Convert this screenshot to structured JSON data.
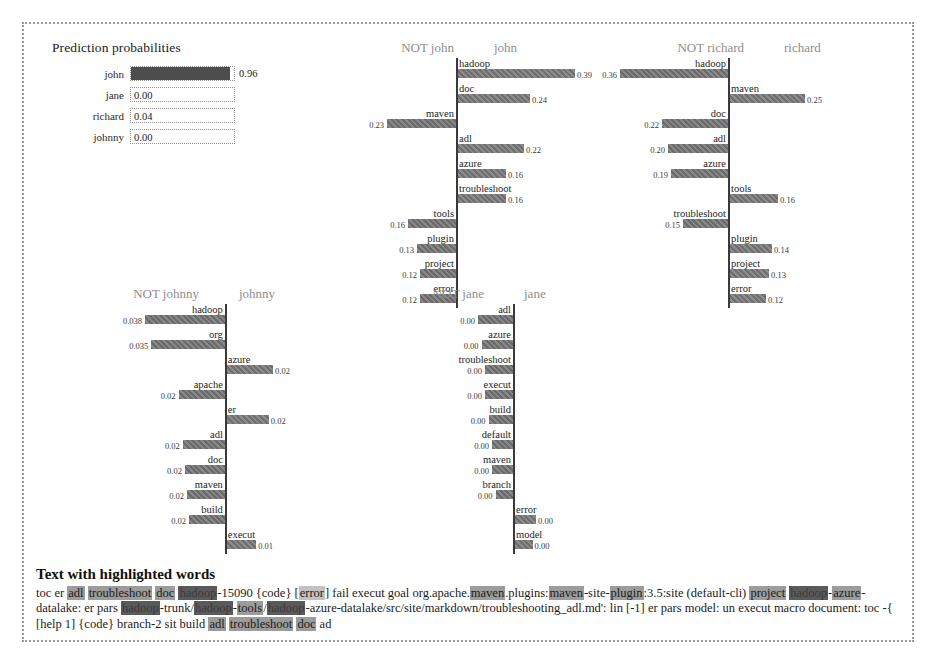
{
  "prediction": {
    "title": "Prediction probabilities",
    "rows": [
      {
        "label": "john",
        "value": "0.96",
        "p": 0.96,
        "filled": true
      },
      {
        "label": "jane",
        "value": "0.00",
        "p": 0.0,
        "filled": false
      },
      {
        "label": "richard",
        "value": "0.04",
        "p": 0.04,
        "filled": false
      },
      {
        "label": "johnny",
        "value": "0.00",
        "p": 0.0,
        "filled": false
      }
    ]
  },
  "panels": [
    {
      "id": "john",
      "neg_label": "NOT john",
      "pos_label": "john",
      "features": [
        {
          "word": "hadoop",
          "value": "0.39",
          "w": 0.39,
          "side": "pos"
        },
        {
          "word": "doc",
          "value": "0.24",
          "w": 0.24,
          "side": "pos"
        },
        {
          "word": "maven",
          "value": "0.23",
          "w": 0.23,
          "side": "neg"
        },
        {
          "word": "adl",
          "value": "0.22",
          "w": 0.22,
          "side": "pos"
        },
        {
          "word": "azure",
          "value": "0.16",
          "w": 0.16,
          "side": "pos"
        },
        {
          "word": "troubleshoot",
          "value": "0.16",
          "w": 0.16,
          "side": "pos"
        },
        {
          "word": "tools",
          "value": "0.16",
          "w": 0.16,
          "side": "neg"
        },
        {
          "word": "plugin",
          "value": "0.13",
          "w": 0.13,
          "side": "neg"
        },
        {
          "word": "project",
          "value": "0.12",
          "w": 0.12,
          "side": "neg"
        },
        {
          "word": "error",
          "value": "0.12",
          "w": 0.12,
          "side": "neg"
        }
      ]
    },
    {
      "id": "richard",
      "neg_label": "NOT richard",
      "pos_label": "richard",
      "features": [
        {
          "word": "hadoop",
          "value": "0.36",
          "w": 0.36,
          "side": "neg"
        },
        {
          "word": "maven",
          "value": "0.25",
          "w": 0.25,
          "side": "pos"
        },
        {
          "word": "doc",
          "value": "0.22",
          "w": 0.22,
          "side": "neg"
        },
        {
          "word": "adl",
          "value": "0.20",
          "w": 0.2,
          "side": "neg"
        },
        {
          "word": "azure",
          "value": "0.19",
          "w": 0.19,
          "side": "neg"
        },
        {
          "word": "tools",
          "value": "0.16",
          "w": 0.16,
          "side": "pos"
        },
        {
          "word": "troubleshoot",
          "value": "0.15",
          "w": 0.15,
          "side": "neg"
        },
        {
          "word": "plugin",
          "value": "0.14",
          "w": 0.14,
          "side": "pos"
        },
        {
          "word": "project",
          "value": "0.13",
          "w": 0.13,
          "side": "pos"
        },
        {
          "word": "error",
          "value": "0.12",
          "w": 0.12,
          "side": "pos"
        }
      ]
    },
    {
      "id": "johnny",
      "neg_label": "NOT johnny",
      "pos_label": "johnny",
      "features": [
        {
          "word": "hadoop",
          "value": "0.038",
          "w": 0.038,
          "side": "neg"
        },
        {
          "word": "org",
          "value": "0.035",
          "w": 0.035,
          "side": "neg"
        },
        {
          "word": "azure",
          "value": "0.02",
          "w": 0.022,
          "side": "pos"
        },
        {
          "word": "apache",
          "value": "0.02",
          "w": 0.022,
          "side": "neg"
        },
        {
          "word": "er",
          "value": "0.02",
          "w": 0.02,
          "side": "pos"
        },
        {
          "word": "adl",
          "value": "0.02",
          "w": 0.02,
          "side": "neg"
        },
        {
          "word": "doc",
          "value": "0.02",
          "w": 0.019,
          "side": "neg"
        },
        {
          "word": "maven",
          "value": "0.02",
          "w": 0.018,
          "side": "neg"
        },
        {
          "word": "build",
          "value": "0.02",
          "w": 0.017,
          "side": "neg"
        },
        {
          "word": "execut",
          "value": "0.01",
          "w": 0.014,
          "side": "pos"
        }
      ]
    },
    {
      "id": "jane",
      "neg_label": "NOT jane",
      "pos_label": "jane",
      "features": [
        {
          "word": "adl",
          "value": "0.00",
          "w": 0.01,
          "side": "neg"
        },
        {
          "word": "azure",
          "value": "0.00",
          "w": 0.009,
          "side": "neg"
        },
        {
          "word": "troubleshoot",
          "value": "0.00",
          "w": 0.008,
          "side": "neg"
        },
        {
          "word": "execut",
          "value": "0.00",
          "w": 0.008,
          "side": "neg"
        },
        {
          "word": "build",
          "value": "0.00",
          "w": 0.007,
          "side": "neg"
        },
        {
          "word": "default",
          "value": "0.00",
          "w": 0.006,
          "side": "neg"
        },
        {
          "word": "maven",
          "value": "0.00",
          "w": 0.006,
          "side": "neg"
        },
        {
          "word": "branch",
          "value": "0.00",
          "w": 0.005,
          "side": "neg"
        },
        {
          "word": "error",
          "value": "0.00",
          "w": 0.006,
          "side": "pos"
        },
        {
          "word": "model",
          "value": "0.00",
          "w": 0.005,
          "side": "pos"
        }
      ]
    }
  ],
  "highlighted_text": {
    "title": "Text with highlighted words",
    "tokens": [
      {
        "t": "toc er ",
        "h": "none"
      },
      {
        "t": "adl",
        "h": "mid"
      },
      {
        "t": " ",
        "h": "none"
      },
      {
        "t": "troubleshoot",
        "h": "mid"
      },
      {
        "t": " ",
        "h": "none"
      },
      {
        "t": "doc",
        "h": "mid"
      },
      {
        "t": " ",
        "h": "none"
      },
      {
        "t": "hadoop",
        "h": "dark"
      },
      {
        "t": "-15090 {code} [",
        "h": "none"
      },
      {
        "t": "error",
        "h": "light"
      },
      {
        "t": "] fail execut goal org.apache.",
        "h": "none"
      },
      {
        "t": "maven",
        "h": "mid"
      },
      {
        "t": ".plugins:",
        "h": "none"
      },
      {
        "t": "maven",
        "h": "mid"
      },
      {
        "t": "-site-",
        "h": "none"
      },
      {
        "t": "plugin",
        "h": "mid"
      },
      {
        "t": ":3.5:site (default-cli) ",
        "h": "none"
      },
      {
        "t": "project",
        "h": "mid"
      },
      {
        "t": " ",
        "h": "none"
      },
      {
        "t": "hadoop",
        "h": "dark"
      },
      {
        "t": "-",
        "h": "none"
      },
      {
        "t": "azure",
        "h": "mid"
      },
      {
        "t": "-datalake: er pars ",
        "h": "none"
      },
      {
        "t": "hadoop",
        "h": "dark"
      },
      {
        "t": "-trunk/",
        "h": "none"
      },
      {
        "t": "hadoop",
        "h": "dark"
      },
      {
        "t": "-",
        "h": "none"
      },
      {
        "t": "tools",
        "h": "mid"
      },
      {
        "t": "/",
        "h": "none"
      },
      {
        "t": "hadoop",
        "h": "dark"
      },
      {
        "t": "-azure-datalake/src/site/markdown/troubleshooting_adl.md': lin [-1] er pars",
        "h": "none"
      },
      {
        "t": " model: un execut macro document: toc -{ [help 1] {code} branch-2 sit build ",
        "h": "none"
      },
      {
        "t": "adl",
        "h": "mid"
      },
      {
        "t": " ",
        "h": "none"
      },
      {
        "t": "troubleshoot",
        "h": "mid"
      },
      {
        "t": " ",
        "h": "none"
      },
      {
        "t": "doc",
        "h": "mid"
      },
      {
        "t": " ad",
        "h": "none"
      }
    ]
  },
  "layout": {
    "panel_boxes": [
      {
        "id": "john",
        "left": 300,
        "top": 16,
        "width": 300,
        "height": 260,
        "rowh": 25,
        "axis_ratio": 0.44,
        "scale": 300
      },
      {
        "id": "richard",
        "left": 590,
        "top": 16,
        "width": 300,
        "height": 260,
        "rowh": 25,
        "axis_ratio": 0.38,
        "scale": 300
      },
      {
        "id": "johnny",
        "left": 50,
        "top": 262,
        "width": 290,
        "height": 255,
        "rowh": 25,
        "axis_ratio": 0.52,
        "scale": 2100
      },
      {
        "id": "jane",
        "left": 330,
        "top": 262,
        "width": 300,
        "height": 255,
        "rowh": 25,
        "axis_ratio": 0.53,
        "scale": 3500
      }
    ]
  }
}
